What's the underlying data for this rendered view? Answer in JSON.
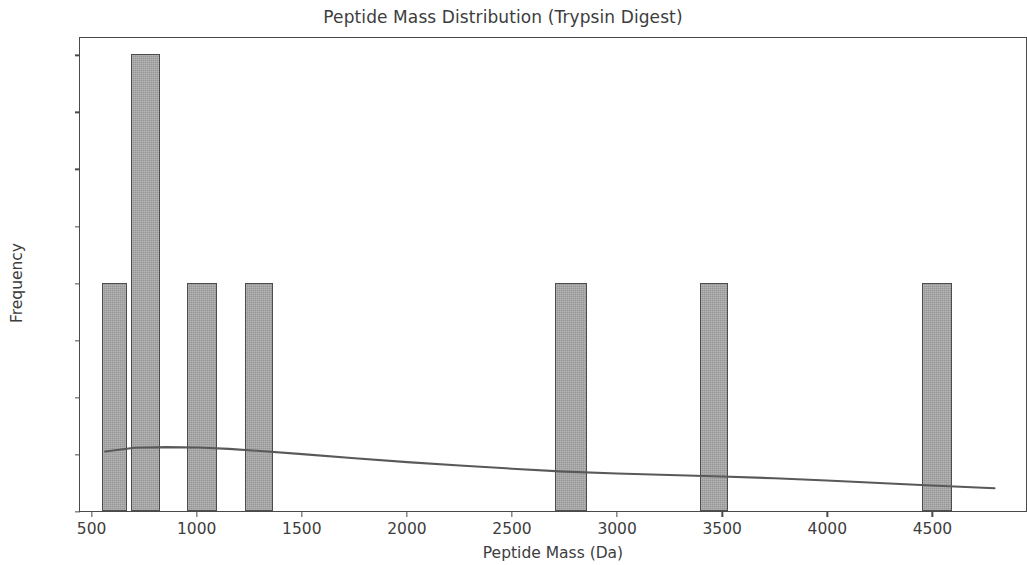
{
  "chart_data": {
    "type": "bar",
    "title": "Peptide Mass Distribution (Trypsin Digest)",
    "xlabel": "Peptide Mass (Da)",
    "ylabel": "Frequency",
    "xlim": [
      440,
      4950
    ],
    "ylim": [
      0.0,
      2.08
    ],
    "grid": false,
    "legend": null,
    "bar_color": "#a6a6a6",
    "bar_edge_color": "#4d4d4d",
    "curve_color": "#595959",
    "axis_color": "#4a4a4a",
    "background": "#ffffff",
    "xticks": [
      500,
      1000,
      1500,
      2000,
      2500,
      3000,
      3500,
      4000,
      4500
    ],
    "xtick_labels": [
      "500",
      "1000",
      "1500",
      "2000",
      "2500",
      "3000",
      "3500",
      "4000",
      "4500"
    ],
    "yticks": [
      0.0,
      0.25,
      0.5,
      0.75,
      1.0,
      1.25,
      1.5,
      1.75,
      2.0
    ],
    "ytick_labels": [
      "0.00",
      "0.25",
      "0.50",
      "0.75",
      "1.00",
      "1.25",
      "1.50",
      "1.75",
      "2.00"
    ],
    "bins": [
      {
        "label": "bin-1",
        "x_start": 543,
        "x_end": 662,
        "center": 602,
        "value": 1
      },
      {
        "label": "bin-2",
        "x_start": 681,
        "x_end": 819,
        "center": 750,
        "value": 2
      },
      {
        "label": "bin-3",
        "x_start": 948,
        "x_end": 1090,
        "center": 1019,
        "value": 1
      },
      {
        "label": "bin-4",
        "x_start": 1224,
        "x_end": 1357,
        "center": 1290,
        "value": 1
      },
      {
        "label": "bin-5",
        "x_start": 2700,
        "x_end": 2852,
        "center": 2776,
        "value": 1
      },
      {
        "label": "bin-6",
        "x_start": 3390,
        "x_end": 3524,
        "center": 3457,
        "value": 1
      },
      {
        "label": "bin-7",
        "x_start": 4448,
        "x_end": 4590,
        "center": 4519,
        "value": 1
      }
    ],
    "density_curve": {
      "name": "kde",
      "x": [
        560,
        700,
        850,
        1000,
        1150,
        1300,
        1500,
        1750,
        2000,
        2250,
        2500,
        2750,
        3000,
        3250,
        3500,
        3750,
        4000,
        4250,
        4500,
        4800
      ],
      "y": [
        0.262,
        0.278,
        0.281,
        0.279,
        0.273,
        0.264,
        0.25,
        0.232,
        0.215,
        0.2,
        0.186,
        0.173,
        0.165,
        0.158,
        0.152,
        0.144,
        0.134,
        0.123,
        0.112,
        0.1
      ]
    }
  }
}
